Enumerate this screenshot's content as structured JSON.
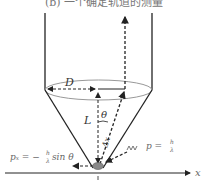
{
  "title": "(b) 一个确定轨道的测量",
  "labels": {
    "diameter": "D",
    "length": "L",
    "angle": "θ",
    "uncertainty": "Δx",
    "momentum": "p = h/λ",
    "momentum_p": "p =",
    "momentum_frac_num": "h",
    "momentum_frac_den": "λ",
    "px": "pₓ = −",
    "px_frac_num": "h",
    "px_frac_den": "λ",
    "px_tail": "sin θ",
    "x_axis": "x"
  },
  "colors": {
    "lines": "#222222",
    "ellipse": "#999999",
    "particle": "#888888",
    "photon": "#555555"
  }
}
